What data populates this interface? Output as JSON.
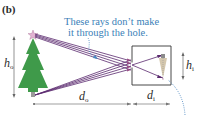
{
  "figure": {
    "panel_label": "(b)",
    "annotation": {
      "line1": "These rays don’t make",
      "line2": "it through the hole."
    },
    "labels": {
      "object_height": {
        "symbol": "h",
        "subscript": "o"
      },
      "image_height": {
        "symbol": "h",
        "subscript": "i"
      },
      "object_distance": {
        "symbol": "d",
        "subscript": "o"
      },
      "image_distance": {
        "symbol": "d",
        "subscript": "i"
      }
    },
    "colors": {
      "tree": "#3f9a4a",
      "rays": "#5a2a6e",
      "annotation": "#3b7fb8",
      "box": "#333333",
      "dimension": "#666666",
      "star": "#d9a3c7",
      "image": "#c9b79a"
    }
  }
}
